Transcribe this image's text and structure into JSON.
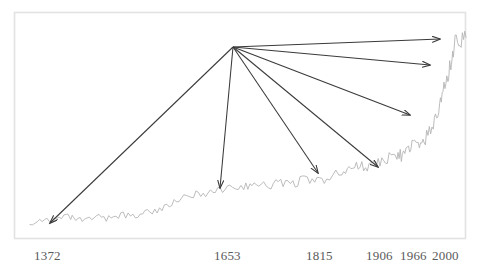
{
  "figure": {
    "title": "",
    "background_color": "#ffffff",
    "frame_color": "#e2e2e2",
    "series_color": "#b4b4b4",
    "arrow_color": "#3a3a3a",
    "label_color": "#5a5a5a"
  },
  "chart_data": {
    "type": "line",
    "title": "",
    "xlabel": "",
    "ylabel": "",
    "grid": false,
    "legend": null,
    "xlim": [
      1300,
      2020
    ],
    "ylim": [
      0,
      100
    ],
    "tick_labels": [
      "1372",
      "1653",
      "1815",
      "1906",
      "1966",
      "2000"
    ],
    "tick_x_px": [
      50,
      220,
      318,
      378,
      414,
      448
    ],
    "series": [
      {
        "name": "trend",
        "comment": "noisy rising series, flat-low until ~1650, gentle rise, steep take-off after 1900, plateau at 2000",
        "x": [
          1300,
          1320,
          1340,
          1360,
          1372,
          1390,
          1410,
          1430,
          1450,
          1470,
          1490,
          1510,
          1530,
          1550,
          1570,
          1590,
          1610,
          1630,
          1653,
          1670,
          1690,
          1710,
          1730,
          1750,
          1770,
          1790,
          1815,
          1830,
          1845,
          1860,
          1875,
          1890,
          1906,
          1915,
          1925,
          1935,
          1945,
          1955,
          1966,
          1975,
          1982,
          1990,
          1995,
          2000,
          2010,
          2020
        ],
        "values": [
          6,
          8,
          7,
          9,
          8,
          7,
          9,
          8,
          10,
          9,
          11,
          12,
          14,
          17,
          19,
          20,
          21,
          22,
          23,
          24,
          23,
          25,
          24,
          26,
          25,
          27,
          29,
          31,
          33,
          32,
          34,
          36,
          38,
          37,
          40,
          43,
          41,
          46,
          52,
          58,
          66,
          74,
          80,
          88,
          92,
          92
        ]
      }
    ],
    "annotations": [
      {
        "name": "arrow-1372",
        "from_px": [
          233,
          47
        ],
        "to_px": [
          50,
          223
        ],
        "target_label": "1372"
      },
      {
        "name": "arrow-1653",
        "from_px": [
          233,
          47
        ],
        "to_px": [
          220,
          188
        ],
        "target_label": "1653"
      },
      {
        "name": "arrow-1815",
        "from_px": [
          233,
          47
        ],
        "to_px": [
          318,
          173
        ],
        "target_label": "1815"
      },
      {
        "name": "arrow-1906",
        "from_px": [
          233,
          47
        ],
        "to_px": [
          378,
          167
        ],
        "target_label": "1906"
      },
      {
        "name": "arrow-1966",
        "from_px": [
          233,
          47
        ],
        "to_px": [
          410,
          115
        ],
        "target_label": "1966"
      },
      {
        "name": "arrow-1990",
        "from_px": [
          233,
          47
        ],
        "to_px": [
          430,
          65
        ],
        "target_label": ""
      },
      {
        "name": "arrow-2000",
        "from_px": [
          233,
          47
        ],
        "to_px": [
          440,
          39
        ],
        "target_label": "2000"
      }
    ]
  },
  "axis": {
    "labels": [
      {
        "text": "1372",
        "x_px": 34,
        "y_px": 249
      },
      {
        "text": "1653",
        "x_px": 214,
        "y_px": 249
      },
      {
        "text": "1815",
        "x_px": 306,
        "y_px": 249
      },
      {
        "text": "1906",
        "x_px": 366,
        "y_px": 249
      },
      {
        "text": "1966",
        "x_px": 400,
        "y_px": 249
      },
      {
        "text": "2000",
        "x_px": 432,
        "y_px": 249
      }
    ]
  }
}
